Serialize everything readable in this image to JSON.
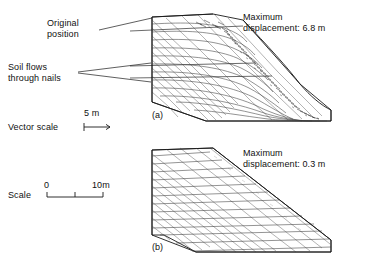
{
  "figure": {
    "annotations": {
      "original_position": "Original\nposition",
      "soil_flows": "Soil flows\nthrough nails",
      "vector_scale_label": "Vector scale",
      "vector_scale_value": "5 m",
      "scale_label": "Scale",
      "scale_zero": "0",
      "scale_max": "10m"
    },
    "panels": [
      {
        "id": "a",
        "caption": "(a)",
        "max_displacement_line1": "Maximum",
        "max_displacement_line2": "displacement: 6.8 m",
        "max_displacement_value": "6.8 m"
      },
      {
        "id": "b",
        "caption": "(b)",
        "max_displacement_line1": "Maximum",
        "max_displacement_line2": "displacement: 0.3 m",
        "max_displacement_value": "0.3 m"
      }
    ],
    "colors": {
      "line": "#1a1a1a",
      "mesh": "#3a3a3a",
      "background": "#ffffff"
    }
  }
}
